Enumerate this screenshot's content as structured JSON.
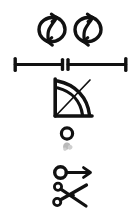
{
  "page": {
    "background_color": "#ffffff",
    "ink_color": "#111111",
    "smudge_color": "#b9b9b9",
    "width": 140,
    "height": 209
  },
  "symbols": [
    {
      "id": "rotation-arrow-left",
      "name": "circular-rotation-arrow",
      "label": "Rotate / refresh (counter-clockwise circular double arrow)",
      "x": 38,
      "y": 13,
      "width": 28,
      "height": 33,
      "color": "#111111"
    },
    {
      "id": "rotation-arrow-right",
      "name": "circular-rotation-arrow",
      "label": "Rotate / refresh (counter-clockwise circular double arrow)",
      "x": 74,
      "y": 13,
      "width": 28,
      "height": 33,
      "color": "#111111"
    },
    {
      "id": "dimension-line",
      "name": "dimension-line-with-break",
      "label": "Horizontal dimension line with end caps and centre break ticks",
      "x": 15,
      "y": 60,
      "width": 112,
      "height": 13,
      "color": "#111111"
    },
    {
      "id": "angle-arcs",
      "name": "angle-with-arcs",
      "label": "Right angle bracket with two arcs and crossing diagonal",
      "x": 54,
      "y": 79,
      "width": 40,
      "height": 40,
      "color": "#111111"
    },
    {
      "id": "circle-with-smudge",
      "name": "small-circle-with-smudge",
      "label": "Small open circle with faint grey smudge below",
      "x": 62,
      "y": 128,
      "width": 16,
      "height": 26,
      "color": "#111111"
    },
    {
      "id": "circle-arrow",
      "name": "circle-with-right-arrow",
      "label": "Open circle joined by a shaft to a right-pointing arrowhead",
      "x": 54,
      "y": 164,
      "width": 38,
      "height": 18,
      "color": "#111111"
    },
    {
      "id": "scissors",
      "name": "scissors",
      "label": "Scissors with two ring handles at left and crossed blades",
      "x": 54,
      "y": 184,
      "width": 38,
      "height": 24,
      "color": "#111111"
    }
  ]
}
